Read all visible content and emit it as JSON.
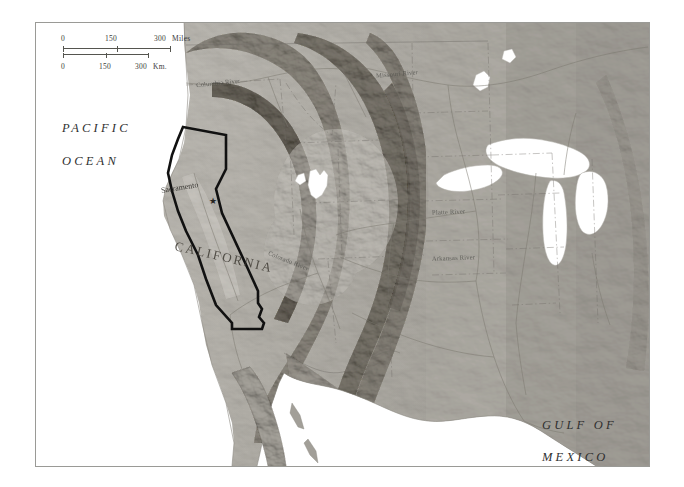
{
  "map": {
    "title_visible": false,
    "region": "Western United States",
    "background_color": "#ffffff",
    "frame_color": "#9a9a96",
    "terrain_palette": {
      "lowland": "#c9c6c0",
      "highland": "#9c9890",
      "mountain": "#6f6b64",
      "water": "#ffffff",
      "plains": "#b5b2ab"
    },
    "scale": {
      "miles": {
        "zero": "0",
        "mid": "150",
        "max": "300",
        "unit": "Miles"
      },
      "km": {
        "zero": "0",
        "mid": "150",
        "max": "300",
        "unit": "Km."
      }
    },
    "water_labels": [
      {
        "name": "pacific-ocean",
        "line1": "PACIFIC",
        "line2": "OCEAN"
      },
      {
        "name": "gulf-of-mexico",
        "line1": "GULF OF",
        "line2": "MEXICO"
      }
    ],
    "state_labels": [
      {
        "name": "california",
        "label": "CALIFORNIA"
      }
    ],
    "cities": [
      {
        "name": "sacramento",
        "label": "Sacramento",
        "marker": "star-marker"
      }
    ],
    "rivers": [
      {
        "name": "columbia-river",
        "label": "Columbia River"
      },
      {
        "name": "missouri-river",
        "label": "Missouri River"
      },
      {
        "name": "colorado-river",
        "label": "Colorado River"
      },
      {
        "name": "platte-river",
        "label": "Platte River"
      },
      {
        "name": "arkansas-river",
        "label": "Arkansas River"
      }
    ],
    "highlight": {
      "name": "california-state-outline",
      "color": "#111111",
      "stroke_width": "2.6"
    }
  }
}
